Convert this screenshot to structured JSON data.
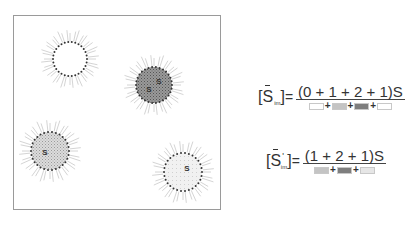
{
  "diagram": {
    "frame": {
      "border_color": "#9a9a9a"
    },
    "cells": [
      {
        "id": "cell-top-left",
        "cx": 70,
        "cy": 59,
        "r": 17,
        "fill": "#ffffff",
        "pattern": "none",
        "labels": []
      },
      {
        "id": "cell-top-right",
        "cx": 154,
        "cy": 85,
        "r": 18,
        "fill": "#8e8e8e",
        "pattern": "dark-dots",
        "labels": [
          {
            "text": "S",
            "dx": 5,
            "dy": -4
          },
          {
            "text": "S",
            "dx": -5,
            "dy": 4
          }
        ]
      },
      {
        "id": "cell-bottom-left",
        "cx": 50,
        "cy": 151,
        "r": 19,
        "fill": "#cfcfcf",
        "pattern": "light-dots",
        "labels": [
          {
            "text": "S",
            "dx": -5,
            "dy": 1
          }
        ]
      },
      {
        "id": "cell-bottom-right",
        "cx": 183,
        "cy": 172,
        "r": 19,
        "fill": "#eeeeee",
        "pattern": "faint",
        "labels": [
          {
            "text": "S",
            "dx": 4,
            "dy": -4
          }
        ]
      }
    ]
  },
  "formulas": [
    {
      "lhs_open": "[",
      "symbol": "S",
      "prime": "",
      "subscript": "im",
      "lhs_close": "]",
      "equals": "=",
      "numerator": "(0 + 1 + 2 + 1)S",
      "denominator": [
        {
          "swatch": "#ffffff"
        },
        {
          "op": "+"
        },
        {
          "swatch": "#c4c4c4"
        },
        {
          "op": "+"
        },
        {
          "swatch": "#7e7e7e"
        },
        {
          "op": "+"
        },
        {
          "swatch": "#ffffff"
        }
      ]
    },
    {
      "lhs_open": "[",
      "symbol": "S",
      "prime": "'",
      "subscript": "im",
      "lhs_close": "]",
      "equals": "=",
      "numerator": "(1 + 2 + 1)S",
      "denominator": [
        {
          "swatch": "#c4c4c4"
        },
        {
          "op": "+"
        },
        {
          "swatch": "#7e7e7e"
        },
        {
          "op": "+"
        },
        {
          "swatch": "#e6e6e6"
        }
      ]
    }
  ]
}
